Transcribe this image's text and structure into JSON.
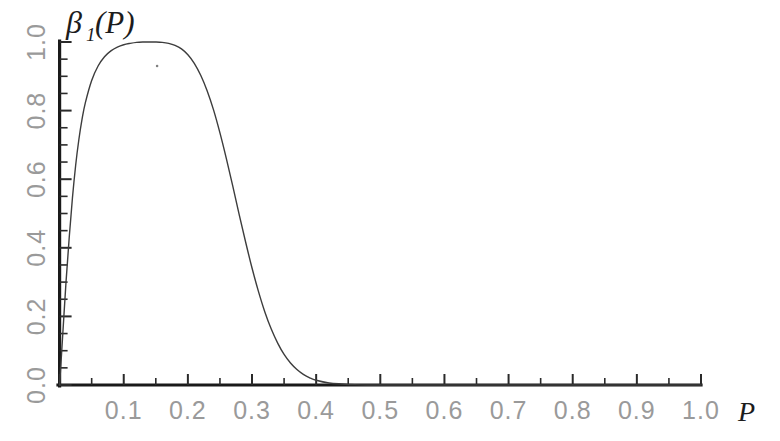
{
  "figure": {
    "background": "#ffffff",
    "curve_color": "#3d3d3d",
    "axis_color": "#1a1a1a",
    "tick_label_color": "#9a9a9a"
  },
  "axes": {
    "y_title": "β",
    "y_title_sub": "1",
    "y_title_arg": "(P)",
    "x_title": "P"
  },
  "chart_data": {
    "type": "line",
    "title": "",
    "subtitle": "",
    "xlabel": "P",
    "ylabel": "β₁(P)",
    "xlim": [
      0.0,
      1.0
    ],
    "ylim": [
      0.0,
      1.0
    ],
    "grid": false,
    "legend": null,
    "x_ticks": [
      0.0,
      0.1,
      0.2,
      0.3,
      0.4,
      0.5,
      0.6,
      0.7,
      0.8,
      0.9,
      1.0
    ],
    "x_tick_labels": [
      "0.0",
      "0.1",
      "0.2",
      "0.3",
      "0.4",
      "0.5",
      "0.6",
      "0.7",
      "0.8",
      "0.9",
      "1.0"
    ],
    "x_minor_tick_step": 0.05,
    "y_ticks": [
      0.0,
      0.2,
      0.4,
      0.6,
      0.8,
      1.0
    ],
    "y_tick_labels": [
      "0.0",
      "0.2",
      "0.4",
      "0.6",
      "0.8",
      "1.0"
    ],
    "y_minor_tick_step": 0.05,
    "y_tick_labels_rotated": true,
    "series": [
      {
        "name": "beta_1",
        "x": [
          0.0,
          0.005,
          0.01,
          0.015,
          0.02,
          0.025,
          0.03,
          0.035,
          0.04,
          0.05,
          0.06,
          0.07,
          0.08,
          0.09,
          0.1,
          0.11,
          0.12,
          0.13,
          0.14,
          0.15,
          0.16,
          0.17,
          0.18,
          0.19,
          0.2,
          0.21,
          0.22,
          0.23,
          0.24,
          0.25,
          0.26,
          0.27,
          0.28,
          0.29,
          0.3,
          0.31,
          0.32,
          0.33,
          0.34,
          0.35,
          0.36,
          0.37,
          0.38,
          0.39,
          0.4,
          0.42,
          0.44,
          0.46,
          0.48,
          0.5,
          0.55,
          0.6,
          0.7,
          0.8,
          0.9,
          1.0
        ],
        "y": [
          0.0,
          0.15,
          0.3,
          0.43,
          0.545,
          0.64,
          0.715,
          0.775,
          0.822,
          0.888,
          0.93,
          0.957,
          0.974,
          0.985,
          0.992,
          0.996,
          0.999,
          1.0,
          1.0,
          1.0,
          0.999,
          0.996,
          0.99,
          0.98,
          0.963,
          0.938,
          0.903,
          0.858,
          0.802,
          0.735,
          0.66,
          0.58,
          0.497,
          0.417,
          0.341,
          0.273,
          0.213,
          0.163,
          0.122,
          0.089,
          0.064,
          0.045,
          0.031,
          0.021,
          0.014,
          0.006,
          0.003,
          0.001,
          0.0,
          0.0,
          0.0,
          0.0,
          0.0,
          0.0,
          0.0,
          0.0
        ],
        "peak_x": 0.145,
        "peak_y": 1.0,
        "color": "#3d3d3d",
        "line_width": 1.4,
        "style": "solid"
      }
    ],
    "annotations": [
      {
        "name": "speck",
        "x": 0.152,
        "y": 0.93
      }
    ]
  }
}
